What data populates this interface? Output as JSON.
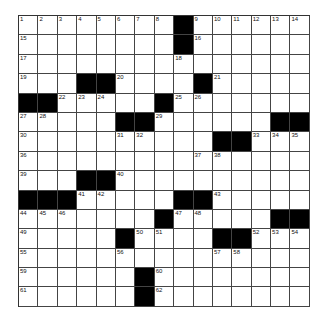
{
  "puzzle": {
    "rows": 15,
    "cols": 15,
    "layout": [
      "........#......",
      "........#......",
      "...............",
      "...##....#.....",
      "##.....#.......",
      ".....##....####"
    ],
    "grid": [
      "........#......",
      "........#......",
      "...............",
      "...##....#.....",
      "##.....#.......",
      ".....##......##",
      "..........##...",
      "...............",
      "...##..........",
      "###.....##.....",
      ".......#.....##",
      ".....#....##...",
      "...............",
      "......#........",
      "......#........"
    ],
    "numbers": [
      {
        "r": 0,
        "c": 0,
        "n": "1"
      },
      {
        "r": 0,
        "c": 1,
        "n": "2"
      },
      {
        "r": 0,
        "c": 2,
        "n": "3"
      },
      {
        "r": 0,
        "c": 3,
        "n": "4"
      },
      {
        "r": 0,
        "c": 4,
        "n": "5"
      },
      {
        "r": 0,
        "c": 5,
        "n": "6"
      },
      {
        "r": 0,
        "c": 6,
        "n": "7"
      },
      {
        "r": 0,
        "c": 7,
        "n": "8"
      },
      {
        "r": 0,
        "c": 9,
        "n": "9"
      },
      {
        "r": 0,
        "c": 10,
        "n": "10"
      },
      {
        "r": 0,
        "c": 11,
        "n": "11"
      },
      {
        "r": 0,
        "c": 12,
        "n": "12"
      },
      {
        "r": 0,
        "c": 13,
        "n": "13"
      },
      {
        "r": 0,
        "c": 14,
        "n": "14"
      },
      {
        "r": 1,
        "c": 0,
        "n": "15"
      },
      {
        "r": 1,
        "c": 9,
        "n": "16"
      },
      {
        "r": 2,
        "c": 0,
        "n": "17"
      },
      {
        "r": 2,
        "c": 8,
        "n": "18"
      },
      {
        "r": 3,
        "c": 0,
        "n": "19"
      },
      {
        "r": 3,
        "c": 5,
        "n": "20"
      },
      {
        "r": 3,
        "c": 10,
        "n": "21"
      },
      {
        "r": 4,
        "c": 2,
        "n": "22"
      },
      {
        "r": 4,
        "c": 3,
        "n": "23"
      },
      {
        "r": 4,
        "c": 4,
        "n": "24"
      },
      {
        "r": 4,
        "c": 8,
        "n": "25"
      },
      {
        "r": 4,
        "c": 9,
        "n": "26"
      },
      {
        "r": 5,
        "c": 0,
        "n": "27"
      },
      {
        "r": 5,
        "c": 1,
        "n": "28"
      },
      {
        "r": 5,
        "c": 7,
        "n": "29"
      },
      {
        "r": 6,
        "c": 0,
        "n": "30"
      },
      {
        "r": 6,
        "c": 5,
        "n": "31"
      },
      {
        "r": 6,
        "c": 6,
        "n": "32"
      },
      {
        "r": 6,
        "c": 12,
        "n": "33"
      },
      {
        "r": 6,
        "c": 13,
        "n": "34"
      },
      {
        "r": 6,
        "c": 14,
        "n": "35"
      },
      {
        "r": 7,
        "c": 0,
        "n": "36"
      },
      {
        "r": 7,
        "c": 9,
        "n": "37"
      },
      {
        "r": 7,
        "c": 10,
        "n": "38"
      },
      {
        "r": 8,
        "c": 0,
        "n": "39"
      },
      {
        "r": 8,
        "c": 5,
        "n": "40"
      },
      {
        "r": 9,
        "c": 3,
        "n": "41"
      },
      {
        "r": 9,
        "c": 4,
        "n": "42"
      },
      {
        "r": 9,
        "c": 10,
        "n": "43"
      },
      {
        "r": 10,
        "c": 0,
        "n": "44"
      },
      {
        "r": 10,
        "c": 1,
        "n": "45"
      },
      {
        "r": 10,
        "c": 2,
        "n": "46"
      },
      {
        "r": 10,
        "c": 8,
        "n": "47"
      },
      {
        "r": 10,
        "c": 9,
        "n": "48"
      },
      {
        "r": 11,
        "c": 0,
        "n": "49"
      },
      {
        "r": 11,
        "c": 6,
        "n": "50"
      },
      {
        "r": 11,
        "c": 7,
        "n": "51"
      },
      {
        "r": 11,
        "c": 12,
        "n": "52"
      },
      {
        "r": 11,
        "c": 13,
        "n": "53"
      },
      {
        "r": 11,
        "c": 14,
        "n": "54"
      },
      {
        "r": 12,
        "c": 0,
        "n": "55"
      },
      {
        "r": 12,
        "c": 5,
        "n": "56"
      },
      {
        "r": 12,
        "c": 10,
        "n": "57"
      },
      {
        "r": 12,
        "c": 11,
        "n": "58"
      },
      {
        "r": 13,
        "c": 0,
        "n": "59"
      },
      {
        "r": 13,
        "c": 7,
        "n": "60"
      },
      {
        "r": 14,
        "c": 0,
        "n": "61"
      },
      {
        "r": 14,
        "c": 7,
        "n": "62"
      }
    ],
    "colors": {
      "block": "#000000",
      "cell": "#ffffff",
      "line": "#444444"
    }
  }
}
